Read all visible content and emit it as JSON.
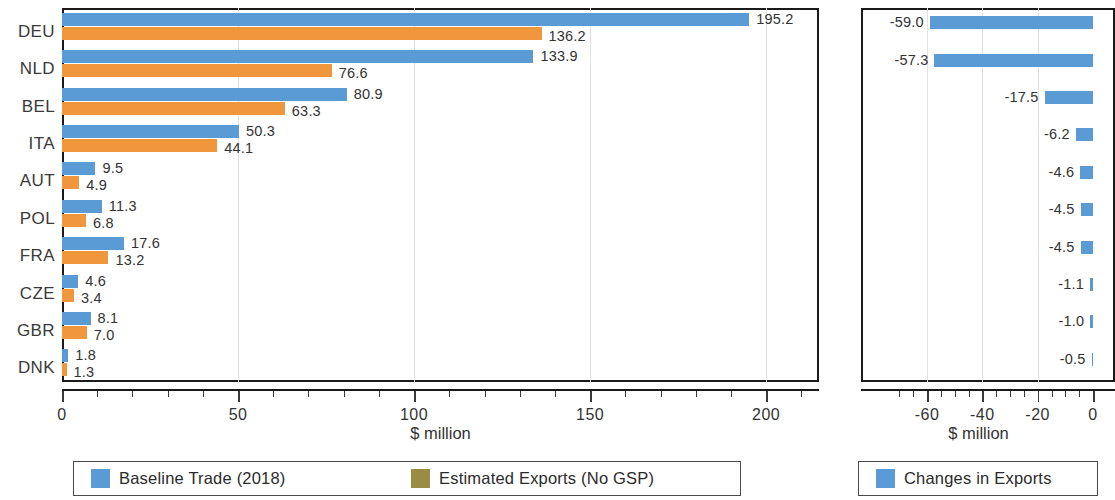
{
  "chart_data": [
    {
      "type": "bar",
      "orientation": "horizontal",
      "id": "left-chart",
      "title": "",
      "xlabel": "$ million",
      "ylabel": "",
      "xlim": [
        0,
        215
      ],
      "xticks": [
        0,
        50,
        100,
        150,
        200
      ],
      "xtick_labels": [
        "0",
        "50",
        "100",
        "150",
        "200"
      ],
      "grid": true,
      "categories": [
        "DEU",
        "NLD",
        "BEL",
        "ITA",
        "AUT",
        "POL",
        "FRA",
        "CZE",
        "GBR",
        "DNK"
      ],
      "series": [
        {
          "name": "Baseline Trade (2018)",
          "color": "#5B9BD5",
          "values": [
            195.2,
            133.9,
            80.9,
            50.3,
            9.5,
            11.3,
            17.6,
            4.6,
            8.1,
            1.8
          ],
          "labels": [
            "195.2",
            "133.9",
            "80.9",
            "50.3",
            "9.5",
            "11.3",
            "17.6",
            "4.6",
            "8.1",
            "1.8"
          ]
        },
        {
          "name": "Estimated Exports (No GSP)",
          "color": "#F0963C",
          "values": [
            136.2,
            76.6,
            63.3,
            44.1,
            4.9,
            6.8,
            13.2,
            3.4,
            7.0,
            1.3
          ],
          "labels": [
            "136.2",
            "76.6",
            "63.3",
            "44.1",
            "4.9",
            "6.8",
            "13.2",
            "3.4",
            "7.0",
            "1.3"
          ]
        }
      ],
      "legend": {
        "position": "bottom",
        "entries": [
          {
            "label": "Baseline Trade (2018)",
            "color": "#5B9BD5"
          },
          {
            "label": "Estimated Exports (No GSP)",
            "color": "#9A8C45"
          }
        ]
      }
    },
    {
      "type": "bar",
      "orientation": "horizontal",
      "id": "right-chart",
      "title": "",
      "xlabel": "$ million",
      "ylabel": "",
      "xlim": [
        -72,
        3
      ],
      "xticks": [
        -60,
        -40,
        -20,
        0
      ],
      "xtick_labels": [
        "-60",
        "-40",
        "-20",
        "0"
      ],
      "grid": true,
      "categories": [
        "",
        "",
        "",
        "",
        "",
        "",
        "",
        "",
        "",
        ""
      ],
      "series": [
        {
          "name": "Changes in Exports",
          "color": "#5B9BD5",
          "values": [
            -59.0,
            -57.3,
            -17.5,
            -6.2,
            -4.6,
            -4.5,
            -4.5,
            -1.1,
            -1.0,
            -0.5
          ],
          "labels": [
            "-59.0",
            "-57.3",
            "-17.5",
            "-6.2",
            "-4.6",
            "-4.5",
            "-4.5",
            "-1.1",
            "-1.0",
            "-0.5"
          ]
        }
      ],
      "legend": {
        "position": "bottom",
        "entries": [
          {
            "label": "Changes in Exports",
            "color": "#5B9BD5"
          }
        ]
      }
    }
  ]
}
